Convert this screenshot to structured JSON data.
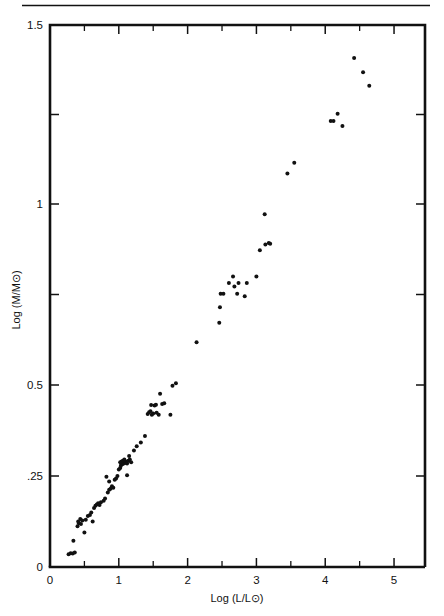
{
  "figure": {
    "rule_label": "horizontal-rule",
    "background_color": "#ffffff",
    "ink_color": "#111111"
  },
  "chart_data": {
    "type": "scatter",
    "title": "",
    "subtitle": "",
    "xlabel": "Log (L/L⊙)",
    "ylabel": "Log (M/M⊙)",
    "xlim": [
      0,
      5.45
    ],
    "ylim": [
      0,
      1.5
    ],
    "grid": false,
    "legend": null,
    "x_major_ticks": [
      0,
      1,
      2,
      3,
      4,
      5
    ],
    "x_major_tick_labels": [
      "0",
      "1",
      "2",
      "3",
      "4",
      "5"
    ],
    "x_minor_ticks": [
      0.5,
      1.5,
      2.5,
      3.5,
      4.5
    ],
    "y_major_ticks": [
      0,
      0.25,
      0.5,
      1,
      1.5
    ],
    "y_major_tick_labels": [
      "0",
      ".25",
      "0.5",
      "1",
      "1.5"
    ],
    "y_minor_ticks": [
      0.75,
      1.25
    ],
    "y_axis_scale": "nonlinear-compressed",
    "marker": "filled-circle",
    "marker_color": "#111111",
    "marker_size_px": 4,
    "point_count": 97,
    "points": [
      [
        0.27,
        0.035
      ],
      [
        0.3,
        0.038
      ],
      [
        0.33,
        0.037
      ],
      [
        0.36,
        0.04
      ],
      [
        0.34,
        0.072
      ],
      [
        0.4,
        0.112
      ],
      [
        0.42,
        0.12
      ],
      [
        0.45,
        0.118
      ],
      [
        0.44,
        0.132
      ],
      [
        0.47,
        0.128
      ],
      [
        0.41,
        0.125
      ],
      [
        0.5,
        0.095
      ],
      [
        0.52,
        0.13
      ],
      [
        0.55,
        0.14
      ],
      [
        0.58,
        0.143
      ],
      [
        0.6,
        0.15
      ],
      [
        0.62,
        0.125
      ],
      [
        0.64,
        0.162
      ],
      [
        0.66,
        0.168
      ],
      [
        0.68,
        0.172
      ],
      [
        0.7,
        0.175
      ],
      [
        0.72,
        0.17
      ],
      [
        0.74,
        0.178
      ],
      [
        0.78,
        0.182
      ],
      [
        0.8,
        0.188
      ],
      [
        0.84,
        0.205
      ],
      [
        0.86,
        0.212
      ],
      [
        0.88,
        0.215
      ],
      [
        0.9,
        0.222
      ],
      [
        0.92,
        0.218
      ],
      [
        0.86,
        0.235
      ],
      [
        0.94,
        0.24
      ],
      [
        0.96,
        0.243
      ],
      [
        0.82,
        0.248
      ],
      [
        0.98,
        0.25
      ],
      [
        1.0,
        0.268
      ],
      [
        1.02,
        0.272
      ],
      [
        1.03,
        0.278
      ],
      [
        1.04,
        0.282
      ],
      [
        1.05,
        0.285
      ],
      [
        1.06,
        0.283
      ],
      [
        1.07,
        0.286
      ],
      [
        1.08,
        0.288
      ],
      [
        1.09,
        0.287
      ],
      [
        1.1,
        0.29
      ],
      [
        1.11,
        0.286
      ],
      [
        1.12,
        0.284
      ],
      [
        1.06,
        0.292
      ],
      [
        1.08,
        0.295
      ],
      [
        1.04,
        0.29
      ],
      [
        1.02,
        0.288
      ],
      [
        1.14,
        0.292
      ],
      [
        1.16,
        0.295
      ],
      [
        1.18,
        0.288
      ],
      [
        1.12,
        0.252
      ],
      [
        1.15,
        0.305
      ],
      [
        1.22,
        0.32
      ],
      [
        1.26,
        0.332
      ],
      [
        1.32,
        0.342
      ],
      [
        1.38,
        0.36
      ],
      [
        1.42,
        0.42
      ],
      [
        1.44,
        0.425
      ],
      [
        1.46,
        0.428
      ],
      [
        1.48,
        0.418
      ],
      [
        1.5,
        0.422
      ],
      [
        1.52,
        0.444
      ],
      [
        1.54,
        0.446
      ],
      [
        1.47,
        0.445
      ],
      [
        1.55,
        0.424
      ],
      [
        1.58,
        0.418
      ],
      [
        1.6,
        0.476
      ],
      [
        1.63,
        0.448
      ],
      [
        1.66,
        0.45
      ],
      [
        1.75,
        0.418
      ],
      [
        1.78,
        0.498
      ],
      [
        1.83,
        0.505
      ],
      [
        2.13,
        0.618
      ],
      [
        2.46,
        0.672
      ],
      [
        2.47,
        0.715
      ],
      [
        2.48,
        0.752
      ],
      [
        2.52,
        0.752
      ],
      [
        2.6,
        0.782
      ],
      [
        2.66,
        0.8
      ],
      [
        2.68,
        0.772
      ],
      [
        2.72,
        0.752
      ],
      [
        2.74,
        0.782
      ],
      [
        2.83,
        0.745
      ],
      [
        2.86,
        0.782
      ],
      [
        3.0,
        0.8
      ],
      [
        3.05,
        0.872
      ],
      [
        3.13,
        0.888
      ],
      [
        3.18,
        0.892
      ],
      [
        3.2,
        0.89
      ],
      [
        3.12,
        0.972
      ],
      [
        3.45,
        1.085
      ],
      [
        3.55,
        1.115
      ],
      [
        4.08,
        1.232
      ],
      [
        4.12,
        1.232
      ],
      [
        4.18,
        1.252
      ],
      [
        4.25,
        1.218
      ],
      [
        4.42,
        1.408
      ],
      [
        4.55,
        1.368
      ],
      [
        4.64,
        1.33
      ]
    ]
  }
}
